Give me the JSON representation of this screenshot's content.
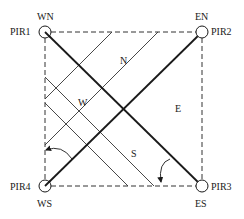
{
  "diagram": {
    "sensors": [
      {
        "id": "PIR1",
        "label": "PIR1",
        "corner": "WN",
        "x": 45,
        "y": 32
      },
      {
        "id": "PIR2",
        "label": "PIR2",
        "corner": "EN",
        "x": 202,
        "y": 32
      },
      {
        "id": "PIR3",
        "label": "PIR3",
        "corner": "ES",
        "x": 202,
        "y": 186
      },
      {
        "id": "PIR4",
        "label": "PIR4",
        "corner": "WS",
        "x": 45,
        "y": 186
      }
    ],
    "corner_labels": {
      "wn": "WN",
      "en": "EN",
      "es": "ES",
      "ws": "WS"
    },
    "sensor_labels": {
      "pir1": "PIR1",
      "pir2": "PIR2",
      "pir3": "PIR3",
      "pir4": "PIR4"
    },
    "regions": {
      "north": "N",
      "west": "W",
      "east": "E",
      "south": "S"
    },
    "colors": {
      "line": "#1a1a1a",
      "background": "#ffffff"
    }
  }
}
